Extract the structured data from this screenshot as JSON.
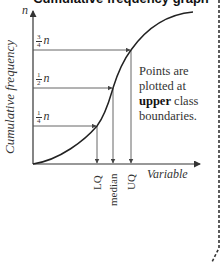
{
  "title": "Cumulative frequency graph",
  "axes": {
    "y_label": "Cumulative frequency",
    "y_top_label": "n",
    "x_label": "Variable"
  },
  "levels": [
    {
      "num": "3",
      "den": "4",
      "var": "n"
    },
    {
      "num": "1",
      "den": "2",
      "var": "n"
    },
    {
      "num": "1",
      "den": "4",
      "var": "n"
    }
  ],
  "x_markers": [
    "LQ",
    "median",
    "UQ"
  ],
  "note": {
    "pre": "Points are plotted at",
    "bold": "upper",
    "post": "class boundaries."
  },
  "colors": {
    "curve": "#222222",
    "lines": "#555555",
    "border": "#333333"
  }
}
